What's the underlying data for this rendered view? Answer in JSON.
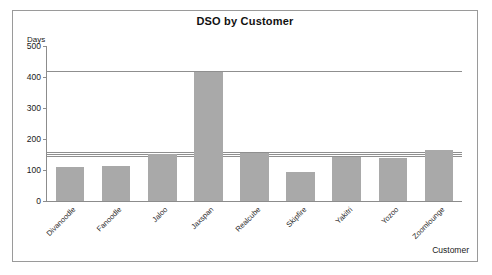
{
  "chart_data": {
    "type": "bar",
    "title": "DSO by Customer",
    "xlabel": "Customer",
    "ylabel": "Days",
    "yunit_label": "Days",
    "categories": [
      "Divanoodle",
      "Fanoodle",
      "Jaloo",
      "Jaxspan",
      "Realcube",
      "Skipfire",
      "Yakitri",
      "Yozoo",
      "Zoomlounge"
    ],
    "values": [
      110,
      112,
      152,
      415,
      155,
      93,
      143,
      138,
      163
    ],
    "ylim": [
      0,
      500
    ],
    "ytick_values": [
      0,
      100,
      200,
      300,
      400,
      500
    ],
    "ytick_labels": [
      "0",
      "100",
      "200",
      "300",
      "400",
      "500"
    ],
    "grid": false,
    "legend": "none",
    "bar_color": "#a9a9a9",
    "axis_color": "#8c8c8c",
    "frame_color": "#9a9a9a",
    "reference_lines": [
      {
        "value": 415,
        "label": ""
      },
      {
        "value": 155,
        "label": ""
      },
      {
        "value": 148,
        "label": ""
      },
      {
        "value": 141,
        "label": ""
      }
    ]
  }
}
